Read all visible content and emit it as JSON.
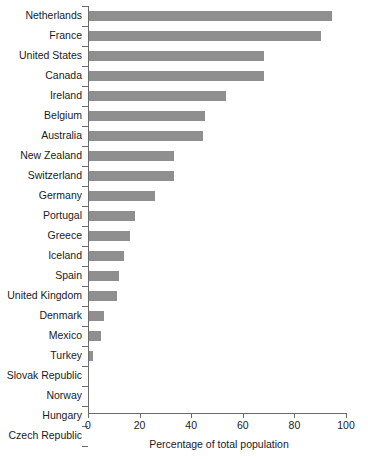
{
  "chart_data": {
    "type": "bar",
    "orientation": "horizontal",
    "title": "",
    "subtitle": "",
    "xlabel": "Percentage of total population",
    "ylabel": "",
    "xlim": [
      0,
      100
    ],
    "xticks": [
      0,
      20,
      40,
      60,
      80,
      100
    ],
    "xtick_labels": [
      "0",
      "20",
      "40",
      "60",
      "80",
      "100"
    ],
    "grid": false,
    "legend": null,
    "bar_color": "#8f8f8f",
    "axis_color": "#6b6b6b",
    "categories": [
      "Netherlands",
      "France",
      "United States",
      "Canada",
      "Ireland",
      "Belgium",
      "Australia",
      "New Zealand",
      "Switzerland",
      "Germany",
      "Portugal",
      "Greece",
      "Iceland",
      "Spain",
      "United Kingdom",
      "Denmark",
      "Mexico",
      "Turkey",
      "Slovak Republic",
      "Norway",
      "Hungary",
      "Czech Republic"
    ],
    "values": [
      94,
      90,
      68,
      68,
      53,
      45,
      44,
      33,
      33,
      25.5,
      18,
      16,
      13.5,
      11.5,
      11,
      6,
      4.5,
      1.5,
      0,
      0,
      0,
      0
    ]
  }
}
